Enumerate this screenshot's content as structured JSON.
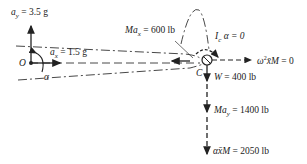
{
  "diagram": {
    "type": "free-body-diagram",
    "point_O": "O",
    "point_C": "C",
    "labels": {
      "ay": "a_y = 3.5 g",
      "ax": "a_x = 1.5 g",
      "alpha": "α",
      "Max": "Ma_x = 600 lb",
      "Ic_alpha": "I_c α = 0",
      "omega": "ω²x̄M = 0",
      "W": "W = 400 lb",
      "May": "Ma_y = 1400 lb",
      "alphaxM": "αx̄M = 2050 lb"
    },
    "parts": {
      "ay_sym": "a",
      "ay_sub": "y",
      "ay_val": " = 3.5 g",
      "ax_sym": "a",
      "ax_sub": "x",
      "ax_val": " = 1.5 g",
      "Max_sym": "Ma",
      "Max_sub": "x",
      "Max_val": " = 600 lb",
      "Ic_sym": "I",
      "Ic_sub": "c",
      "Ic_val": " α = 0",
      "om_sym": "ω",
      "om_sup": "2",
      "om_rest": "x̄M",
      "om_val": " = 0",
      "W_sym": "W",
      "W_val": " = 400 lb",
      "May_sym": "Ma",
      "May_sub": "y",
      "May_val": " = 1400 lb",
      "axm_sym": "αx̄M",
      "axm_val": " = 2050 lb"
    },
    "colors": {
      "ink": "#222222",
      "background": "#ffffff"
    }
  }
}
